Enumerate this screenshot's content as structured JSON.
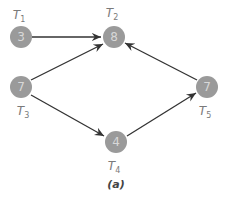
{
  "diagram": {
    "caption": "(a)",
    "nodes": [
      {
        "id": "T1",
        "label": "T",
        "sub": "1",
        "value": "3",
        "x": 21,
        "y": 37,
        "label_x": 19,
        "label_y": 19
      },
      {
        "id": "T2",
        "label": "T",
        "sub": "2",
        "value": "8",
        "x": 114,
        "y": 37,
        "label_x": 112,
        "label_y": 17
      },
      {
        "id": "T3",
        "label": "T",
        "sub": "3",
        "value": "7",
        "x": 21,
        "y": 87,
        "label_x": 23,
        "label_y": 115
      },
      {
        "id": "T4",
        "label": "T",
        "sub": "4",
        "value": "4",
        "x": 116,
        "y": 142,
        "label_x": 114,
        "label_y": 170
      },
      {
        "id": "T5",
        "label": "T",
        "sub": "5",
        "value": "7",
        "x": 207,
        "y": 87,
        "label_x": 205,
        "label_y": 115
      }
    ],
    "edges": [
      {
        "from": "T1",
        "to": "T2"
      },
      {
        "from": "T3",
        "to": "T2"
      },
      {
        "from": "T3",
        "to": "T4"
      },
      {
        "from": "T4",
        "to": "T5"
      },
      {
        "from": "T5",
        "to": "T2"
      }
    ],
    "colors": {
      "node": "#9a9a9a",
      "node_text": "#d8d8d8",
      "label": "#7a7a7a",
      "edge": "#333333"
    }
  }
}
